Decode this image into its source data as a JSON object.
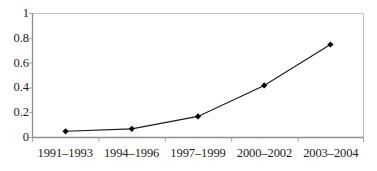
{
  "chart_data": {
    "type": "line",
    "title": "",
    "subtitle": "",
    "xlabel": "",
    "ylabel": "",
    "categories": [
      "1991–1993",
      "1994–1996",
      "1997–1999",
      "2000–2002",
      "2003–2004"
    ],
    "values": [
      0.05,
      0.07,
      0.17,
      0.42,
      0.75
    ],
    "series": [
      {
        "name": "",
        "values": [
          0.05,
          0.07,
          0.17,
          0.42,
          0.75
        ]
      }
    ],
    "ylim": [
      0,
      1
    ],
    "y_ticks": [
      "0",
      "0.2",
      "0.4",
      "0.6",
      "0.8",
      "1"
    ],
    "y_tick_values": [
      0,
      0.2,
      0.4,
      0.6,
      0.8,
      1
    ],
    "grid": false,
    "legend": "none",
    "marker": "diamond",
    "colors": {
      "line": "#1a1a1a",
      "marker": "#000000",
      "frame": "#b9b9b9",
      "axis": "#9a9a9a",
      "text": "#1c1c1c",
      "background": "#ffffff"
    }
  }
}
